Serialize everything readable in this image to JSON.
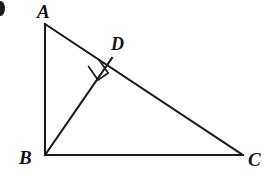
{
  "figure": {
    "kind": "geometry-diagram",
    "background_color": "#ffffff",
    "stroke_color": "#1a1a1a",
    "label_color": "#121212",
    "stroke_width": 2,
    "labels": {
      "a": "A",
      "b": "B",
      "c": "C",
      "d": "D"
    },
    "points": {
      "A": {
        "x": 45,
        "y": 24
      },
      "B": {
        "x": 45,
        "y": 155
      },
      "C": {
        "x": 243,
        "y": 155
      },
      "D": {
        "x": 112,
        "y": 58
      }
    },
    "segments": [
      {
        "name": "AB",
        "from": "A",
        "to": "B"
      },
      {
        "name": "BC",
        "from": "B",
        "to": "C"
      },
      {
        "name": "AC",
        "from": "A",
        "to": "C"
      },
      {
        "name": "BD",
        "from": "B",
        "to": "D"
      }
    ],
    "right_angle_markers": [
      {
        "name": "right-angle-at-D",
        "vertex": "D",
        "size": 14
      }
    ],
    "edge_artifact": {
      "name": "clipped-bullet-mark",
      "visible": true
    }
  }
}
